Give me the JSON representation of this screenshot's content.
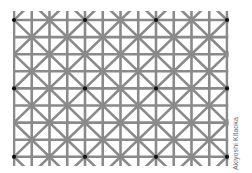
{
  "figure": {
    "credit": "Akiyoshi Kitaoka",
    "background_color": "#ffffff",
    "line_color": "#8a8a8a",
    "dot_color": "#111111",
    "grid": {
      "columns": 13,
      "rows": 9,
      "x_start": 14,
      "x_step": 17.75,
      "y_start": 20,
      "y_step": 17.1,
      "line_width": 2.6,
      "clip": {
        "x0": 13,
        "y0": 11,
        "x1": 228.5,
        "y1": 166
      }
    },
    "diagonals": {
      "pattern": "X crossings on lattice points where (col+row) is even"
    },
    "dots": {
      "radius": 2.1,
      "positions": [
        {
          "col": 0,
          "row": 0
        },
        {
          "col": 4,
          "row": 0
        },
        {
          "col": 8,
          "row": 0
        },
        {
          "col": 12,
          "row": 0
        },
        {
          "col": 0,
          "row": 4
        },
        {
          "col": 4,
          "row": 4
        },
        {
          "col": 8,
          "row": 4
        },
        {
          "col": 12,
          "row": 4
        },
        {
          "col": 0,
          "row": 8
        },
        {
          "col": 4,
          "row": 8
        },
        {
          "col": 8,
          "row": 8
        },
        {
          "col": 12,
          "row": 8
        }
      ]
    }
  }
}
